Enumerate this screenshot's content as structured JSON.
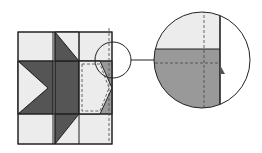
{
  "diagram": {
    "colors": {
      "light": "#ececec",
      "dark": "#555555",
      "medium": "#999999",
      "outline": "#222222",
      "background": "#ffffff"
    },
    "block": {
      "grid_columns": 3,
      "grid_rows": 3,
      "elements": [
        "corner-squares",
        "flying-geese-units",
        "center-square",
        "dashed-seam-lines"
      ]
    },
    "magnifier": {
      "small_circle": "highlight over top-right seam intersection",
      "large_circle": "enlarged view of seam intersection",
      "connector": "line linking small circle to enlarged view"
    }
  }
}
